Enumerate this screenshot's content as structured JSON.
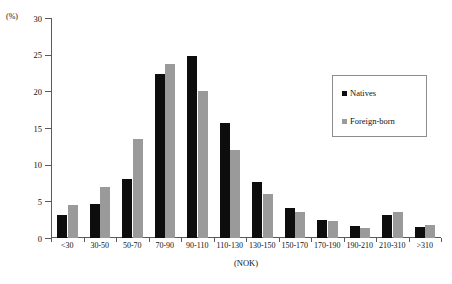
{
  "chart_data": {
    "type": "bar",
    "title": "",
    "subtitle": "",
    "xlabel": "(NOK)",
    "ylabel": "(%)",
    "ylim": [
      0,
      30
    ],
    "yticks": [
      0,
      5,
      10,
      15,
      20,
      25,
      30
    ],
    "ytick_labels": [
      "0",
      "5",
      "10",
      "15",
      "20",
      "25",
      "30"
    ],
    "grid": false,
    "legend_position": "upper right",
    "categories": [
      "<30",
      "30-50",
      "50-70",
      "70-90",
      "90-110",
      "110-130",
      "130-150",
      "150-170",
      "170-190",
      "190-210",
      "210-310",
      ">310"
    ],
    "series": [
      {
        "name": "Natives",
        "color": "#0d0d0d",
        "values": [
          3.2,
          4.6,
          8.1,
          22.4,
          24.8,
          15.7,
          7.6,
          4.1,
          2.5,
          1.6,
          3.2,
          1.5
        ]
      },
      {
        "name": "Foreign-born",
        "color": "#9a9a9a",
        "values": [
          4.5,
          6.9,
          13.5,
          23.7,
          20.0,
          12.0,
          6.0,
          3.5,
          2.3,
          1.4,
          3.6,
          1.8
        ]
      }
    ]
  },
  "axes": {
    "y_unit_label": "(%)",
    "x_title": "(NOK)"
  },
  "legend": {
    "entries": [
      {
        "label": "Natives",
        "swatch": "black-square-icon"
      },
      {
        "label": "Foreign-born",
        "swatch": "gray-square-icon"
      }
    ]
  }
}
